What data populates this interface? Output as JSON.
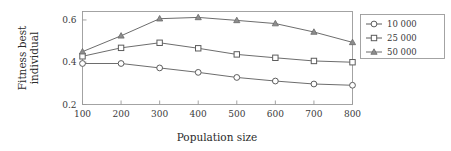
{
  "chart_data": {
    "type": "line",
    "title": "",
    "xlabel": "Population size",
    "ylabel": "Fitness best individual",
    "ylabel_lines": [
      "Fitness best",
      "individual"
    ],
    "x": [
      100,
      200,
      300,
      400,
      500,
      600,
      700,
      800
    ],
    "xtick_labels": [
      "100",
      "200",
      "300",
      "400",
      "500",
      "600",
      "700",
      "800"
    ],
    "ytick_labels": [
      "0.2",
      "0.4",
      "0.6"
    ],
    "ytick_values": [
      0.2,
      0.4,
      0.6
    ],
    "xlim": [
      100,
      800
    ],
    "ylim": [
      0.2,
      0.64
    ],
    "grid": false,
    "legend_position": "right-outside",
    "series": [
      {
        "name": "10 000",
        "marker": "circle",
        "color": "#5c5c5c",
        "values": [
          0.394,
          0.394,
          0.373,
          0.352,
          0.328,
          0.311,
          0.297,
          0.291
        ]
      },
      {
        "name": "25 000",
        "marker": "square",
        "color": "#5c5c5c",
        "values": [
          0.428,
          0.468,
          0.492,
          0.466,
          0.437,
          0.421,
          0.406,
          0.4
        ]
      },
      {
        "name": "50 000",
        "marker": "triangle",
        "color": "#6a6a6a",
        "values": [
          0.45,
          0.525,
          0.606,
          0.612,
          0.598,
          0.583,
          0.543,
          0.494
        ]
      }
    ]
  },
  "legend": {
    "entries": [
      {
        "label": "10 000"
      },
      {
        "label": "25 000"
      },
      {
        "label": "50 000"
      }
    ]
  },
  "axes": {
    "x_title": "Population size",
    "y_title_line1": "Fitness best",
    "y_title_line2": "individual"
  }
}
